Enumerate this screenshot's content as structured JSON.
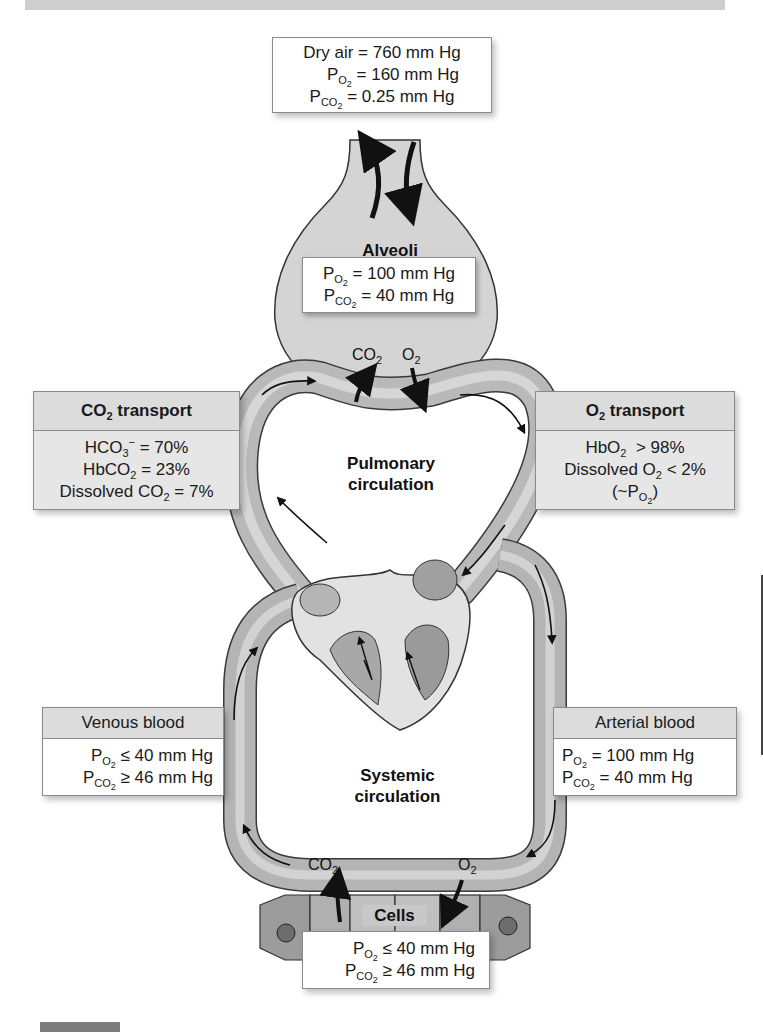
{
  "atmosphere": {
    "line1": "Dry air = 760 mm Hg",
    "po2": "= 160 mm Hg",
    "pco2": "= 0.25 mm Hg"
  },
  "alveoli": {
    "label": "Alveoli",
    "po2": "= 100 mm Hg",
    "pco2": "= 40 mm Hg",
    "gas_out": "CO",
    "gas_in": "O"
  },
  "co2_transport": {
    "title_main": "CO",
    "title_rest": " transport",
    "rows": [
      {
        "main": "HCO",
        "sub": "3",
        "sup": "−",
        "value": " = 70%"
      },
      {
        "main": "HbCO",
        "sub": "2",
        "value": " = 23%"
      },
      {
        "main": "Dissolved CO",
        "sub": "2",
        "value": " = 7%"
      }
    ]
  },
  "o2_transport": {
    "title_main": "O",
    "title_rest": " transport",
    "rows": [
      {
        "main": "HbO",
        "sub": "2",
        "value": "  > 98%"
      },
      {
        "main": "Dissolved O",
        "sub": "2",
        "value": " < 2%"
      },
      {
        "main": "(~P",
        "sub": "O2",
        "value": ")"
      }
    ]
  },
  "pulmonary": {
    "label_line1": "Pulmonary",
    "label_line2": "circulation"
  },
  "systemic": {
    "label_line1": "Systemic",
    "label_line2": "circulation",
    "gas_out": "CO",
    "gas_in": "O"
  },
  "venous": {
    "title": "Venous blood",
    "po2": "≤ 40 mm Hg",
    "pco2": "≥ 46 mm Hg"
  },
  "arterial": {
    "title": "Arterial blood",
    "po2": "= 100 mm Hg",
    "pco2": "= 40 mm Hg"
  },
  "cells": {
    "label": "Cells",
    "po2": "≤ 40 mm Hg",
    "pco2": "≥ 46 mm Hg"
  },
  "symbols": {
    "P": "P",
    "O2": "O",
    "CO2": "CO",
    "two": "2"
  },
  "colors": {
    "vessel": "#a9a9a9",
    "vessel_light": "#cfcfcf",
    "alveolus": "#d4d4d4",
    "box_header": "#dcdcdc",
    "arrow": "#111111"
  }
}
